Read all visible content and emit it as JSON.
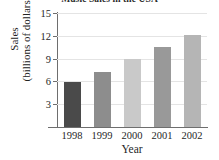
{
  "chart_data": {
    "type": "bar",
    "title": "Music Sales in the USA",
    "xlabel": "Year",
    "ylabel": "Sales (billions of dollars)",
    "ylabel_line1": "Sales",
    "ylabel_line2": "(billions of dollars)",
    "categories": [
      "1998",
      "1999",
      "2000",
      "2001",
      "2002"
    ],
    "values": [
      5.9,
      7.25,
      8.9,
      10.5,
      12.1
    ],
    "ylim": [
      0,
      15
    ],
    "yticks": [
      3,
      6,
      9,
      12,
      15
    ],
    "ytick_labels": [
      "3",
      "6",
      "9",
      "12",
      "15"
    ],
    "grid": true,
    "legend": "none",
    "bar_colors": [
      "#4a4a4a",
      "#8d8d8d",
      "#c9c9c9",
      "#999999",
      "#b5b5b5"
    ],
    "axis_color": "#6e6e6e",
    "gridline_color": "#e4e4e4",
    "background": "#ffffff"
  }
}
